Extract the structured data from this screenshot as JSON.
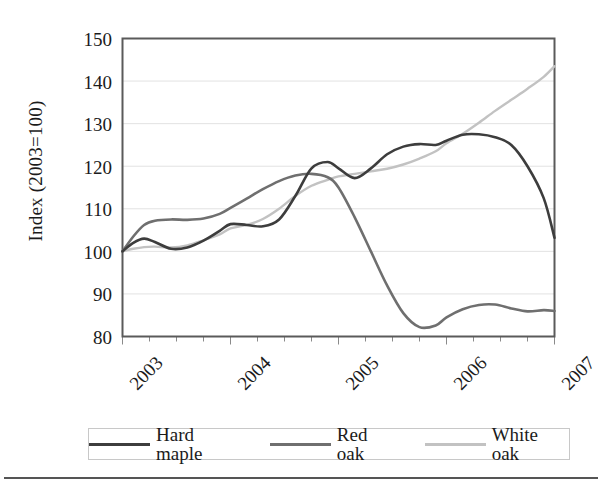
{
  "chart_data": {
    "type": "line",
    "title": "",
    "subtitle": "",
    "xlabel": "",
    "ylabel": "Index (2003=100)",
    "ylim": [
      80,
      150
    ],
    "ytick_labels": [
      "150",
      "140",
      "130",
      "120",
      "110",
      "100",
      "90",
      "80"
    ],
    "ytick_values": [
      150,
      140,
      130,
      120,
      110,
      100,
      90,
      80
    ],
    "xtick_labels": [
      "2003",
      "2004",
      "2005",
      "2006",
      "2007"
    ],
    "xtick_values": [
      2003,
      2004,
      2005,
      2006,
      2007
    ],
    "xlim": [
      2003,
      2007
    ],
    "grid": "horizontal",
    "legend_position": "bottom",
    "x": [
      2003.0,
      2003.1,
      2003.2,
      2003.3,
      2003.45,
      2003.6,
      2003.75,
      2003.9,
      2004.0,
      2004.15,
      2004.3,
      2004.45,
      2004.6,
      2004.75,
      2004.9,
      2005.0,
      2005.15,
      2005.3,
      2005.45,
      2005.6,
      2005.75,
      2005.9,
      2006.0,
      2006.15,
      2006.3,
      2006.45,
      2006.6,
      2006.75,
      2006.9,
      2007.0
    ],
    "series": [
      {
        "name": "Hard maple",
        "color": "#3d3d3d",
        "width": 2.6,
        "values": [
          100.0,
          102.0,
          103.0,
          102.2,
          100.6,
          100.9,
          102.5,
          104.8,
          106.4,
          106.2,
          105.9,
          107.5,
          113.0,
          119.5,
          121.0,
          119.5,
          117.2,
          119.5,
          122.8,
          124.6,
          125.2,
          125.0,
          126.0,
          127.4,
          127.5,
          126.8,
          125.0,
          120.0,
          112.5,
          103.2
        ]
      },
      {
        "name": "Red oak",
        "color": "#6f6f6f",
        "width": 2.6,
        "values": [
          100.0,
          103.5,
          106.2,
          107.2,
          107.5,
          107.4,
          107.7,
          108.8,
          110.2,
          112.4,
          114.6,
          116.5,
          117.8,
          118.2,
          117.4,
          115.0,
          108.0,
          100.0,
          92.0,
          85.5,
          82.2,
          82.6,
          84.5,
          86.4,
          87.4,
          87.5,
          86.6,
          85.9,
          86.2,
          86.0
        ]
      },
      {
        "name": "White oak",
        "color": "#c2c2c2",
        "width": 2.4,
        "values": [
          100.0,
          100.6,
          101.0,
          101.1,
          100.9,
          101.4,
          102.6,
          104.0,
          105.4,
          106.2,
          107.6,
          110.0,
          113.0,
          115.4,
          116.8,
          117.6,
          118.2,
          118.8,
          119.4,
          120.4,
          121.8,
          123.5,
          125.4,
          127.6,
          130.2,
          133.0,
          135.6,
          138.2,
          141.0,
          143.5
        ]
      }
    ]
  },
  "legend": {
    "items": [
      {
        "label": "Hard maple",
        "color": "#3d3d3d",
        "thickness": "3px"
      },
      {
        "label": "Red oak",
        "color": "#6f6f6f",
        "thickness": "3px"
      },
      {
        "label": "White oak",
        "color": "#c2c2c2",
        "thickness": "3px"
      }
    ]
  },
  "axes": {
    "y_title": "Index (2003=100)"
  }
}
